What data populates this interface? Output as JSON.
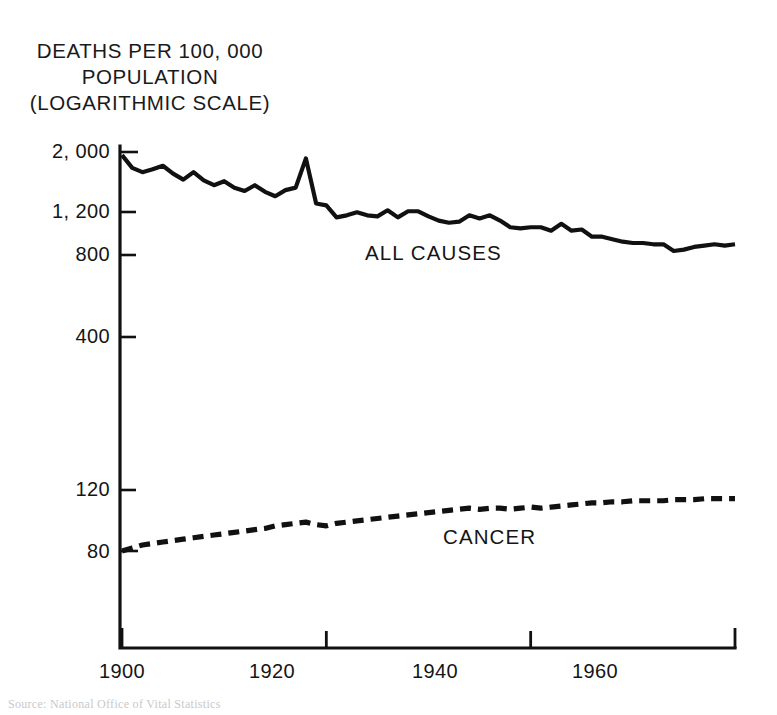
{
  "figure": {
    "axis_title_lines": "DEATHS PER 100, 000\nPOPULATION\n(LOGARITHMIC SCALE)",
    "source_note": "Source:  National Office of Vital Statistics"
  },
  "chart_data": {
    "type": "line",
    "title": "DEATHS PER 100, 000 POPULATION (LOGARITHMIC SCALE)",
    "xlabel": "",
    "ylabel": "DEATHS PER 100, 000 POPULATION (LOGARITHMIC SCALE)",
    "yscale": "log",
    "ylim": [
      60,
      2200
    ],
    "xlim": [
      1900,
      1960
    ],
    "grid": false,
    "legend": "inline-annotations",
    "ytick_labels": [
      "2, 000",
      "1, 200",
      "800",
      "400",
      "120",
      "80"
    ],
    "ytick_values": [
      2000,
      1200,
      800,
      400,
      120,
      80
    ],
    "xtick_labels": [
      "1900",
      "1920",
      "1940",
      "1960"
    ],
    "xtick_values": [
      1900,
      1920,
      1940,
      1960
    ],
    "series": [
      {
        "name": "ALL CAUSES",
        "style": "solid",
        "color": "#111111",
        "label_x": 1933,
        "label_y": 950,
        "x": [
          1900,
          1901,
          1902,
          1903,
          1904,
          1905,
          1906,
          1907,
          1908,
          1909,
          1910,
          1911,
          1912,
          1913,
          1914,
          1915,
          1916,
          1917,
          1918,
          1919,
          1920,
          1921,
          1922,
          1923,
          1924,
          1925,
          1926,
          1927,
          1928,
          1929,
          1930,
          1931,
          1932,
          1933,
          1934,
          1935,
          1936,
          1937,
          1938,
          1939,
          1940,
          1941,
          1942,
          1943,
          1944,
          1945,
          1946,
          1947,
          1948,
          1949,
          1950,
          1951,
          1952,
          1953,
          1954,
          1955,
          1956,
          1957,
          1958,
          1959,
          1960
        ],
        "values": [
          1950,
          1760,
          1700,
          1740,
          1790,
          1680,
          1600,
          1700,
          1590,
          1530,
          1580,
          1500,
          1460,
          1530,
          1450,
          1400,
          1470,
          1500,
          1900,
          1320,
          1300,
          1180,
          1200,
          1230,
          1200,
          1190,
          1250,
          1180,
          1240,
          1240,
          1190,
          1150,
          1130,
          1140,
          1200,
          1170,
          1200,
          1150,
          1090,
          1080,
          1090,
          1090,
          1060,
          1120,
          1060,
          1070,
          1010,
          1010,
          990,
          970,
          960,
          960,
          950,
          950,
          900,
          910,
          930,
          940,
          950,
          940,
          950
        ]
      },
      {
        "name": "CANCER",
        "style": "dashed",
        "color": "#111111",
        "label_x": 1938,
        "label_y": 95,
        "x": [
          1900,
          1901,
          1902,
          1903,
          1904,
          1905,
          1906,
          1907,
          1908,
          1909,
          1910,
          1911,
          1912,
          1913,
          1914,
          1915,
          1916,
          1917,
          1918,
          1919,
          1920,
          1921,
          1922,
          1923,
          1924,
          1925,
          1926,
          1927,
          1928,
          1929,
          1930,
          1931,
          1932,
          1933,
          1934,
          1935,
          1936,
          1937,
          1938,
          1939,
          1940,
          1941,
          1942,
          1943,
          1944,
          1945,
          1946,
          1947,
          1948,
          1949,
          1950,
          1951,
          1952,
          1953,
          1954,
          1955,
          1956,
          1957,
          1958,
          1959,
          1960
        ],
        "values": [
          80,
          82,
          84,
          85,
          86,
          87,
          88,
          89,
          90,
          91,
          92,
          93,
          94,
          95,
          96,
          98,
          99,
          100,
          101,
          99,
          98,
          100,
          101,
          102,
          103,
          104,
          105,
          106,
          107,
          108,
          109,
          110,
          111,
          112,
          113,
          112,
          113,
          113,
          112,
          113,
          114,
          113,
          114,
          115,
          116,
          117,
          118,
          118,
          119,
          119,
          120,
          120,
          120,
          120,
          121,
          121,
          121,
          122,
          122,
          122,
          122
        ]
      }
    ]
  }
}
